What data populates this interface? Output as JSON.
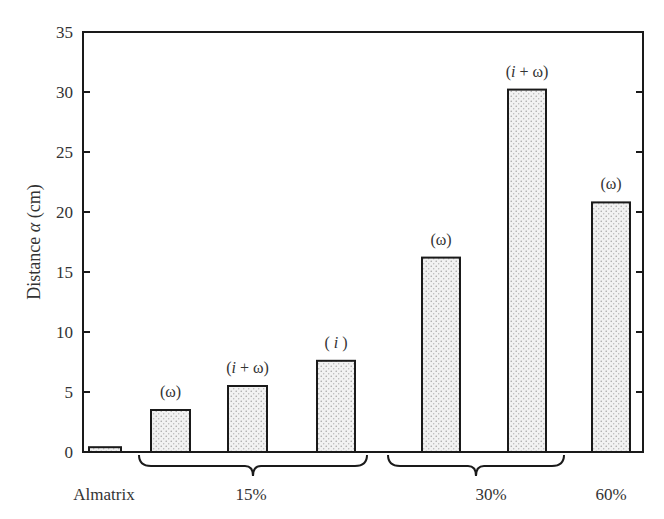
{
  "chart_data": {
    "type": "bar",
    "title": "",
    "xlabel": "",
    "ylabel": "Distance α (cm)",
    "ylabel_parts": {
      "pre": "Distance ",
      "symbol": "α",
      "post": " (cm)"
    },
    "ylim": [
      0,
      35
    ],
    "yticks": [
      0,
      5,
      10,
      15,
      20,
      25,
      30,
      35
    ],
    "grid": false,
    "legend": null,
    "bars": [
      {
        "group": "Almatrix",
        "annotation": "",
        "value": 0.4
      },
      {
        "group": "15%",
        "annotation": "(ω)",
        "value": 3.5
      },
      {
        "group": "15%",
        "annotation": "(i + ω)",
        "value": 5.5
      },
      {
        "group": "15%",
        "annotation": "( i )",
        "value": 7.6
      },
      {
        "group": "30%",
        "annotation": "(ω)",
        "value": 16.2
      },
      {
        "group": "30%",
        "annotation": "(i + ω)",
        "value": 30.2
      },
      {
        "group": "60%",
        "annotation": "(ω)",
        "value": 20.8
      }
    ],
    "categories": [
      "Almatrix",
      "15%",
      "30%",
      "60%"
    ],
    "category_braces": [
      {
        "label": "15%",
        "spans_bars": [
          1,
          3
        ]
      },
      {
        "label": "30%",
        "spans_bars": [
          4,
          5
        ]
      }
    ],
    "fill_pattern": "dotted-stipple",
    "colors": {
      "bar_fill": "#ececec",
      "bar_dot": "#9a9a9a",
      "stroke": "#1a1a1a",
      "text": "#333333"
    }
  }
}
